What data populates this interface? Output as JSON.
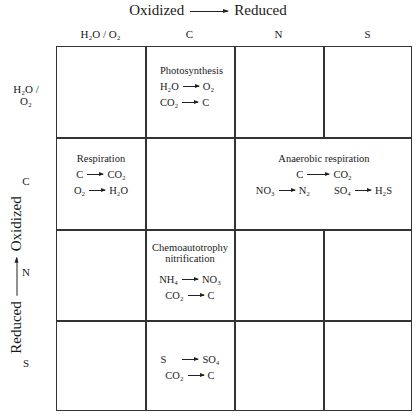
{
  "axes": {
    "top": {
      "from": "Oxidized",
      "to": "Reduced"
    },
    "left": {
      "from": "Reduced",
      "to": "Oxidized"
    }
  },
  "columns": [
    "H₂O / O₂",
    "C",
    "N",
    "S"
  ],
  "rows": [
    "H₂O / O₂",
    "C",
    "N",
    "S"
  ],
  "cells": {
    "photosynthesis": {
      "title": "Photosynthesis",
      "eq1": {
        "from": "H₂O",
        "to": "O₂"
      },
      "eq2": {
        "from": "CO₂",
        "to": "C"
      }
    },
    "respiration": {
      "title": "Respiration",
      "eq1": {
        "from": "C",
        "to": "CO₂"
      },
      "eq2": {
        "from": "O₂",
        "to": "H₂O"
      }
    },
    "anaerobic": {
      "title": "Anaerobic respiration",
      "eq1": {
        "from": "C",
        "to": "CO₂"
      },
      "eq2": {
        "from": "NO₃",
        "to": "N₂"
      },
      "eq3": {
        "from": "SO₄",
        "to": "H₂S"
      }
    },
    "chemo_n": {
      "title1": "Chemoautotrophy",
      "title2": "nitrification",
      "eq1": {
        "from": "NH₄",
        "to": "NO₃"
      },
      "eq2": {
        "from": "CO₂",
        "to": "C"
      }
    },
    "chemo_s": {
      "eq1": {
        "from": "S",
        "to": "SO₄"
      },
      "eq2": {
        "from": "CO₂",
        "to": "C"
      }
    }
  }
}
